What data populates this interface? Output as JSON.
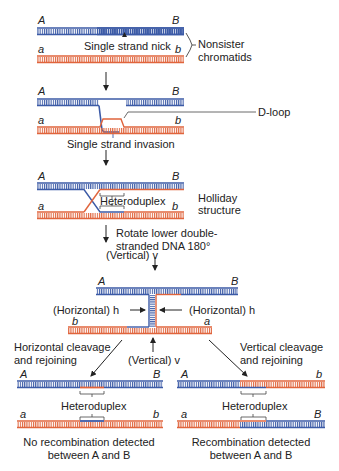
{
  "colors": {
    "blue_strand": "#3b5aa6",
    "red_strand": "#e0643c",
    "text": "#222222",
    "arrow": "#222222"
  },
  "step1": {
    "top_left": "A",
    "top_right": "B",
    "bottom_left": "a",
    "bottom_right": "b",
    "nick_label": "Single strand nick",
    "brace_label_line1": "Nonsister",
    "brace_label_line2": "chromatids"
  },
  "step2": {
    "top_left": "A",
    "top_right": "B",
    "bottom_left": "a",
    "bottom_right": "b",
    "dloop_label": "D-loop",
    "caption": "Single strand invasion"
  },
  "step3": {
    "top_left": "A",
    "top_right": "B",
    "bottom_left": "a",
    "bottom_right": "b",
    "heteroduplex_label": "Heteroduplex",
    "side_label_line1": "Holliday",
    "side_label_line2": "structure",
    "rotate_line1": "Rotate lower double-",
    "rotate_line2": "stranded DNA 180°"
  },
  "step4": {
    "vertical_top": "(Vertical) v",
    "horizontal_left": "(Horizontal) h",
    "horizontal_right": "(Horizontal) h",
    "vertical_bottom": "(Vertical) v",
    "top_left": "A",
    "top_right": "B",
    "bottom_left": "b",
    "bottom_right": "a"
  },
  "outcome_left": {
    "title_line1": "Horizontal cleavage",
    "title_line2": "and rejoining",
    "top_left": "A",
    "top_right": "B",
    "bottom_left": "a",
    "bottom_right": "b",
    "heteroduplex_label": "Heteroduplex",
    "result_line1": "No recombination detected",
    "result_line2": "between A and B"
  },
  "outcome_right": {
    "title_line1": "Vertical cleavage",
    "title_line2": "and rejoining",
    "top_left": "A",
    "top_right": "b",
    "bottom_left": "a",
    "bottom_right": "B",
    "heteroduplex_label": "Heteroduplex",
    "result_line1": "Recombination detected",
    "result_line2": "between A and B"
  }
}
